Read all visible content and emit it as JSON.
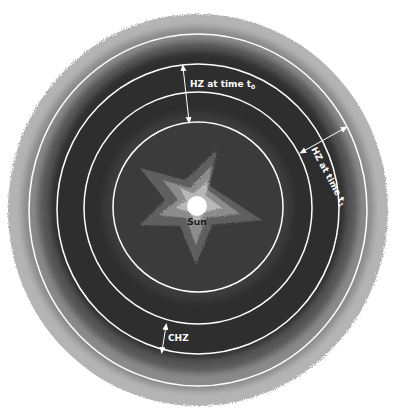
{
  "diagram": {
    "center_label": "Sun",
    "labels": {
      "hz_t0": "HZ at time t",
      "hz_t0_sub": "0",
      "hz_t1": "HZ at time t",
      "hz_t1_sub": "1",
      "chz": "CHZ"
    },
    "rings": [
      {
        "name": "inner-hz-t0-boundary",
        "radius": 85
      },
      {
        "name": "inner-hz-t1-boundary",
        "radius": 114
      },
      {
        "name": "outer-hz-t0-boundary",
        "radius": 142
      },
      {
        "name": "outer-hz-t1-boundary",
        "radius": 171
      }
    ],
    "colors": {
      "background": "#ffffff",
      "outer_halo": "#b4b4b4",
      "mid_band": "#8a8a8a",
      "inner_band": "#575757",
      "core": "#2f2f2f",
      "star_outer": "#5e5e5e",
      "star_mid": "#8c8c8c",
      "star_inner": "#b8b8b8",
      "sun": "#ffffff",
      "ring_stroke": "#ffffff"
    }
  }
}
